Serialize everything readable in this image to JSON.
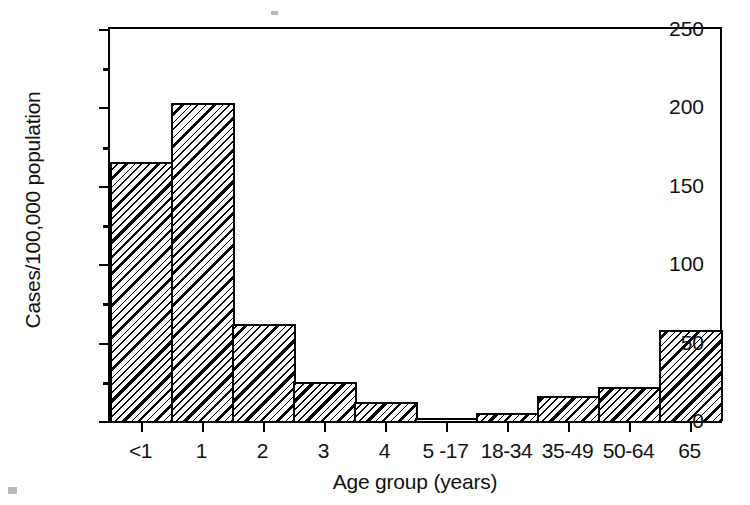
{
  "chart_data": {
    "type": "bar",
    "title": "",
    "xlabel": "Age group (years)",
    "ylabel": "Cases/100,000 population",
    "categories": [
      "<1",
      "1",
      "2",
      "3",
      "4",
      "5 -17",
      "18-34",
      "35-49",
      "50-64",
      "65"
    ],
    "values": [
      165,
      203,
      62,
      25,
      12,
      1,
      5,
      16,
      22,
      58
    ],
    "ylim": [
      0,
      250
    ],
    "ytick_labels": [
      "0",
      "50",
      "100",
      "150",
      "200",
      "250"
    ],
    "ytick_values": [
      0,
      50,
      100,
      150,
      200,
      250
    ],
    "yminor_values": [
      25,
      75,
      125,
      175,
      225
    ],
    "grid": false,
    "legend": false,
    "legend_position": "none",
    "bar_fill": "diagonal-hatch",
    "colors": {
      "axis": "#000000",
      "bar_edge": "#000000",
      "bar_fill": "#ffffff",
      "hatch": "#000000",
      "background": "#ffffff",
      "text": "#111111"
    }
  }
}
